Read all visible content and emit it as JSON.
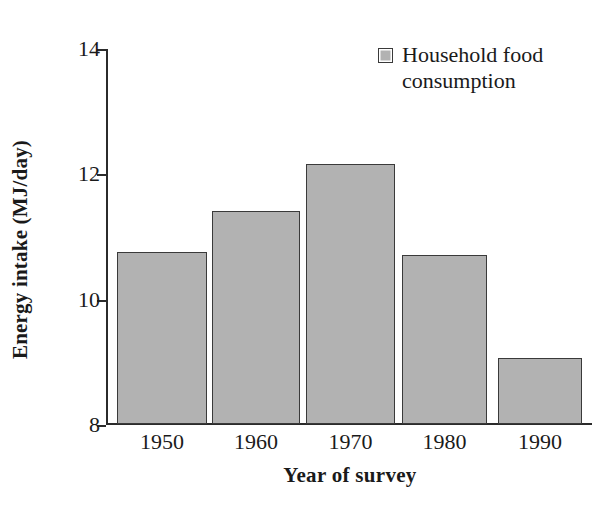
{
  "chart_data": {
    "type": "bar",
    "title": "",
    "subtitle": "",
    "xlabel": "Year of survey",
    "ylabel": "Energy intake (MJ/day)",
    "categories": [
      "1950",
      "1960",
      "1970",
      "1980",
      "1990"
    ],
    "values": [
      10.75,
      11.4,
      12.15,
      10.7,
      9.05
    ],
    "series": [
      {
        "name": "Household food consumption",
        "values": [
          10.75,
          11.4,
          12.15,
          10.7,
          9.05
        ]
      }
    ],
    "ylim": [
      8,
      14
    ],
    "yticks": [
      8,
      10,
      12,
      14
    ],
    "ytick_labels": [
      "8",
      "10",
      "12",
      "14"
    ],
    "xlim_categories": 5,
    "grid": false,
    "legend": {
      "position": "top-right",
      "entries": [
        {
          "label": "Household food consumption",
          "label_line_1": "Household food",
          "label_line_2": "consumption",
          "swatch_icon": "filled-square-icon",
          "fill_color": "#b2b2b2",
          "border_color": "#3a3a3a"
        }
      ]
    },
    "bar_fill_color": "#b2b2b2",
    "bar_border_color": "#3a3a3a",
    "axis_color": "#2b2b2b",
    "background_color": "#ffffff"
  },
  "axes": {
    "y_title": "Energy intake (MJ/day)",
    "x_title": "Year of survey",
    "y_ticks": [
      {
        "label": "14",
        "value": 14
      },
      {
        "label": "12",
        "value": 12
      },
      {
        "label": "10",
        "value": 10
      },
      {
        "label": "8",
        "value": 8
      }
    ],
    "x_ticks": [
      {
        "label": "1950"
      },
      {
        "label": "1960"
      },
      {
        "label": "1970"
      },
      {
        "label": "1980"
      },
      {
        "label": "1990"
      }
    ]
  },
  "bars": [
    {
      "category": "1950",
      "value": 10.75
    },
    {
      "category": "1960",
      "value": 11.4
    },
    {
      "category": "1970",
      "value": 12.15
    },
    {
      "category": "1980",
      "value": 10.7
    },
    {
      "category": "1990",
      "value": 9.05
    }
  ],
  "legend": {
    "line_1": "Household food",
    "line_2": "consumption"
  }
}
